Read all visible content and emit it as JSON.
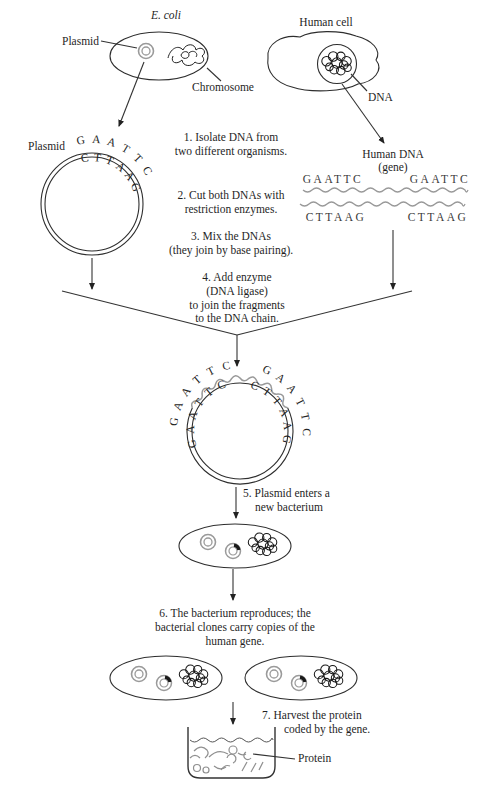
{
  "colors": {
    "ink": "#222222",
    "gray": "#9a9a9a"
  },
  "top_section": {
    "ecoli_label": "E. coli",
    "plasmid_label": "Plasmid",
    "chromosome_label": "Chromosome",
    "human_cell_label": "Human cell",
    "dna_label": "DNA"
  },
  "left_plasmid": {
    "label": "Plasmid",
    "outer_sequence": "GAATTC",
    "inner_sequence": "CTTAAG"
  },
  "human_dna": {
    "title": "Human DNA",
    "subtitle": "(gene)",
    "top_left_sequence": "GAATTC",
    "top_right_sequence": "GAATTC",
    "bottom_left_sequence": "CTTAAG",
    "bottom_right_sequence": "CTTAAG"
  },
  "steps": {
    "step1": {
      "lines": [
        "1. Isolate DNA from",
        "two different organisms."
      ]
    },
    "step2": {
      "lines": [
        "2. Cut both DNAs with",
        "restriction enzymes."
      ]
    },
    "step3": {
      "lines": [
        "3. Mix the DNAs",
        "(they join by base pairing)."
      ]
    },
    "step4": {
      "lines": [
        "4. Add enzyme",
        "(DNA ligase)",
        "to join the  fragments",
        "to the DNA chain."
      ]
    },
    "step5": {
      "lines": [
        "5. Plasmid enters a",
        "new bacterium"
      ]
    },
    "step6": {
      "lines": [
        "6.  The bacterium reproduces; the",
        "bacterial clones carry copies of the",
        "human gene."
      ]
    },
    "step7": {
      "lines": [
        "7.  Harvest the protein",
        "coded by the gene."
      ]
    }
  },
  "recombinant_plasmid": {
    "outer_left_sequence": "GAATTC",
    "outer_right_sequence": "GAATTC",
    "inner_left_sequence": "CTTAAG",
    "inner_right_sequence": "CTTAAG"
  },
  "beaker": {
    "protein_label": "Protein"
  }
}
